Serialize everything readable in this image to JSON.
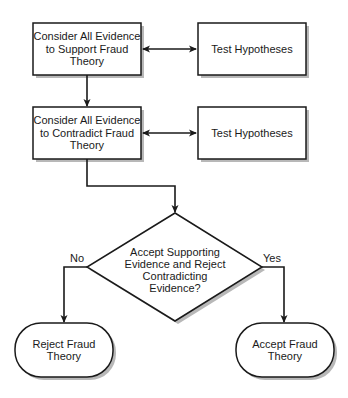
{
  "diagram": {
    "type": "flowchart",
    "nodes": {
      "support": {
        "shape": "process",
        "text": "Consider All Evidence\nto Support Fraud\nTheory"
      },
      "test1": {
        "shape": "process",
        "text": "Test Hypotheses"
      },
      "contradict": {
        "shape": "process",
        "text": "Consider All Evidence\nto Contradict Fraud\nTheory"
      },
      "test2": {
        "shape": "process",
        "text": "Test Hypotheses"
      },
      "decision": {
        "shape": "decision",
        "text": "Accept Supporting\nEvidence and Reject\nContradicting\nEvidence?"
      },
      "reject": {
        "shape": "terminal",
        "text": "Reject Fraud\nTheory"
      },
      "accept": {
        "shape": "terminal",
        "text": "Accept Fraud\nTheory"
      }
    },
    "edges": [
      {
        "from": "support",
        "to": "test1",
        "bidirectional": true,
        "label": ""
      },
      {
        "from": "support",
        "to": "contradict",
        "bidirectional": false,
        "label": ""
      },
      {
        "from": "contradict",
        "to": "test2",
        "bidirectional": true,
        "label": ""
      },
      {
        "from": "contradict",
        "to": "decision",
        "bidirectional": false,
        "label": ""
      },
      {
        "from": "decision",
        "to": "reject",
        "bidirectional": false,
        "label": "No"
      },
      {
        "from": "decision",
        "to": "accept",
        "bidirectional": false,
        "label": "Yes"
      }
    ],
    "colors": {
      "stroke": "#1a1a1a",
      "fill": "#ffffff",
      "shadow": "#b8b8b8",
      "text": "#1a1a1a"
    }
  }
}
